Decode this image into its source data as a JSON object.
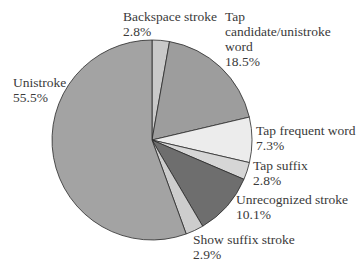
{
  "chart_data": {
    "type": "pie",
    "title": "",
    "start_angle_deg": 0,
    "direction": "clockwise",
    "slices": [
      {
        "name": "Backspace stroke",
        "value": 2.8,
        "pct_label": "2.8%",
        "color": "#c9c9c9"
      },
      {
        "name": "Tap candidate/unistroke word",
        "value": 18.5,
        "pct_label": "18.5%",
        "color": "#9d9d9d"
      },
      {
        "name": "Tap frequent word",
        "value": 7.3,
        "pct_label": "7.3%",
        "color": "#ececec"
      },
      {
        "name": "Tap suffix",
        "value": 2.8,
        "pct_label": "2.8%",
        "color": "#d6d6d6"
      },
      {
        "name": "Unrecognized stroke",
        "value": 10.1,
        "pct_label": "10.1%",
        "color": "#6e6e6e"
      },
      {
        "name": "Show suffix stroke",
        "value": 2.9,
        "pct_label": "2.9%",
        "color": "#cdcdcd"
      },
      {
        "name": "Unistroke",
        "value": 55.5,
        "pct_label": "55.5%",
        "color": "#a3a3a3"
      }
    ]
  },
  "labels": {
    "backspace": {
      "line1": "Backspace stroke",
      "line2": "2.8%"
    },
    "tap_candidate": {
      "line1": "Tap",
      "line2": "candidate/unistroke",
      "line3": "word",
      "line4": "18.5%"
    },
    "tap_frequent": {
      "line1": "Tap frequent word",
      "line2": "7.3%"
    },
    "tap_suffix": {
      "line1": "Tap suffix",
      "line2": "2.8%"
    },
    "unrecognized": {
      "line1": "Unrecognized stroke",
      "line2": "10.1%"
    },
    "show_suffix": {
      "line1": "Show suffix stroke",
      "line2": "2.9%"
    },
    "unistroke": {
      "line1": "Unistroke",
      "line2": "55.5%"
    }
  }
}
